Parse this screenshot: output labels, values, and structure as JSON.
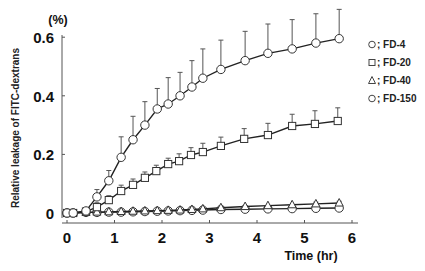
{
  "chart_data": {
    "type": "line",
    "title": "",
    "xlabel": "Time (hr)",
    "ylabel": "Relative leakage of FITC-dextrans",
    "yunit": "(%)",
    "xlim": [
      0,
      6
    ],
    "ylim": [
      0,
      0.6
    ],
    "xticks": [
      "0",
      "1",
      "2",
      "3",
      "4",
      "5",
      "6"
    ],
    "yticks": [
      "0",
      "0.2",
      "0.4",
      "0.6"
    ],
    "grid": false,
    "legend_position": "upper right",
    "error_bars": "upper SD only",
    "series": [
      {
        "name": "FD-4",
        "marker": "circle",
        "x": [
          0,
          0.13,
          0.4,
          0.63,
          0.88,
          1.14,
          1.39,
          1.64,
          1.9,
          2.13,
          2.38,
          2.63,
          2.86,
          3.24,
          3.75,
          4.23,
          4.74,
          5.24,
          5.73
        ],
        "y": [
          0,
          0,
          0.007,
          0.055,
          0.11,
          0.19,
          0.25,
          0.3,
          0.355,
          0.372,
          0.4,
          0.43,
          0.46,
          0.49,
          0.52,
          0.545,
          0.56,
          0.58,
          0.595
        ],
        "err": [
          0,
          0,
          0.01,
          0.025,
          0.035,
          0.07,
          0.08,
          0.08,
          0.07,
          0.09,
          0.08,
          0.09,
          0.1,
          0.1,
          0.1,
          0.1,
          0.1,
          0.1,
          0.1
        ]
      },
      {
        "name": "FD-20",
        "marker": "square",
        "x": [
          0,
          0.13,
          0.4,
          0.63,
          0.88,
          1.14,
          1.39,
          1.64,
          1.88,
          2.13,
          2.36,
          2.61,
          2.86,
          3.24,
          3.73,
          4.23,
          4.74,
          5.22,
          5.7
        ],
        "y": [
          0,
          0,
          0.005,
          0.02,
          0.044,
          0.075,
          0.096,
          0.12,
          0.143,
          0.167,
          0.177,
          0.198,
          0.208,
          0.229,
          0.253,
          0.266,
          0.297,
          0.304,
          0.314
        ],
        "err": [
          0,
          0,
          0.005,
          0.015,
          0.015,
          0.02,
          0.02,
          0.02,
          0.02,
          0.02,
          0.025,
          0.025,
          0.03,
          0.03,
          0.035,
          0.04,
          0.04,
          0.045,
          0.045
        ]
      },
      {
        "name": "FD-40",
        "marker": "triangle",
        "x": [
          0,
          0.13,
          0.4,
          0.63,
          0.88,
          1.14,
          1.39,
          1.64,
          1.9,
          2.13,
          2.38,
          2.63,
          2.86,
          3.24,
          3.75,
          4.23,
          4.74,
          5.24,
          5.73
        ],
        "y": [
          0,
          0,
          0.002,
          0.003,
          0.004,
          0.005,
          0.006,
          0.007,
          0.008,
          0.009,
          0.01,
          0.012,
          0.014,
          0.018,
          0.022,
          0.025,
          0.028,
          0.031,
          0.034
        ],
        "err": [
          0,
          0,
          0,
          0,
          0,
          0,
          0,
          0,
          0,
          0,
          0,
          0,
          0,
          0,
          0,
          0,
          0,
          0.006,
          0.006
        ]
      },
      {
        "name": "FD-150",
        "marker": "circle",
        "x": [
          0,
          0.13,
          0.4,
          0.63,
          0.88,
          1.14,
          1.39,
          1.64,
          1.9,
          2.13,
          2.38,
          2.63,
          2.86,
          3.24,
          3.75,
          4.23,
          4.74,
          5.24,
          5.73
        ],
        "y": [
          0,
          0,
          0.002,
          0.002,
          0.003,
          0.003,
          0.004,
          0.005,
          0.006,
          0.007,
          0.008,
          0.009,
          0.01,
          0.012,
          0.013,
          0.014,
          0.015,
          0.016,
          0.017
        ],
        "err": [
          0,
          0,
          0,
          0,
          0,
          0,
          0,
          0,
          0,
          0,
          0,
          0,
          0,
          0,
          0,
          0,
          0,
          0,
          0
        ]
      }
    ]
  },
  "legend": {
    "items": [
      {
        "symbol": "○",
        "sep": ";",
        "label": "FD-4"
      },
      {
        "symbol": "□",
        "sep": ";",
        "label": "FD-20"
      },
      {
        "symbol": "△",
        "sep": ";",
        "label": "FD-40"
      },
      {
        "symbol": "○",
        "sep": ";",
        "label": "FD-150"
      }
    ]
  }
}
